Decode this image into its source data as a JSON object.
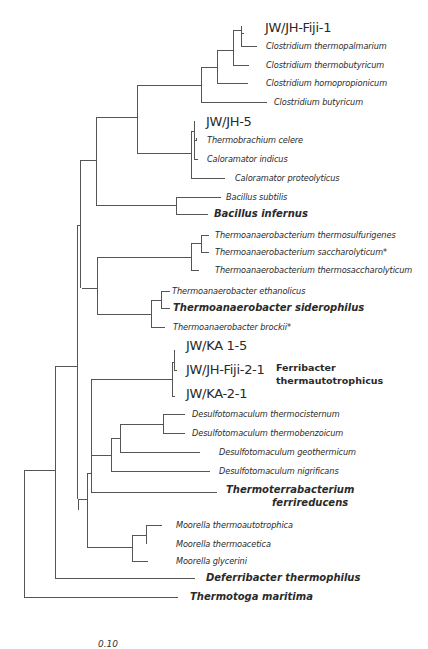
{
  "figure": {
    "scale_bar_label": "0.10"
  },
  "taxa": {
    "jwjh_fiji_1": "JW/JH-Fiji-1",
    "c_thermopalmarium": "Clostridium thermopalmarium",
    "c_thermobutyricum": "Clostridium thermobutyricum",
    "c_homopropionicum": "Clostridium homopropionicum",
    "c_butyricum": "Clostridium butyricum",
    "jwjh_5": "JW/JH-5",
    "thermobrachium_celere": "Thermobrachium celere",
    "caloramator_indicus": "Caloramator indicus",
    "caloramator_proteolyticus": "Caloramator proteolyticus",
    "bacillus_subtilis": "Bacillus subtilis",
    "bacillus_infernus": "Bacillus infernus",
    "tab_thermosulfurigenes": "Thermoanaerobacterium thermosulfurigenes",
    "tab_saccharolyticum": "Thermoanaerobacterium saccharolyticum*",
    "tab_thermosaccharolyticum": "Thermoanaerobacterium thermosaccharolyticum",
    "ta_ethanolicus": "Thermoanaerobacter ethanolicus",
    "ta_siderophilus": "Thermoanaerobacter siderophilus",
    "ta_brockii": "Thermoanaerobacter brockii*",
    "jwka_1_5": "JW/KA 1-5",
    "jwjh_fiji_2_1": "JW/JH-Fiji-2-1",
    "jwka_2_1": "JW/KA-2-1",
    "ferribacter_line1": "Ferribacter",
    "ferribacter_line2": "thermautotrophicus",
    "d_thermocisternum": "Desulfotomaculum thermocisternum",
    "d_thermobenzoicum": "Desulfotomaculum thermobenzoicum",
    "d_geothermicum": "Desulfotomaculum geothermicum",
    "d_nigrificans": "Desulfotomaculum nigrificans",
    "thermoterrabacterium_line1": "Thermoterrabacterium",
    "thermoterrabacterium_line2": "ferrireducens",
    "m_thermoautotrophica": "Moorella  thermoautotrophica",
    "m_thermoacetica": "Moorella thermoacetica",
    "m_glycerini": "Moorella glycerini",
    "deferribacter": "Deferribacter thermophilus",
    "thermotoga": "Thermotoga maritima"
  }
}
